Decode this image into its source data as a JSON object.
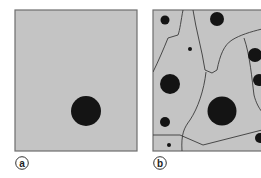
{
  "colors": {
    "panel_fill": "#c4c4c4",
    "panel_border": "#6e6e6e",
    "particle": "#141414",
    "boundary": "#3a3a3a",
    "label_stroke": "#333333"
  },
  "panels": [
    {
      "id": "a",
      "label": "a",
      "description": "single particle",
      "rect": {
        "x": 15,
        "y": 10,
        "w": 122,
        "h": 141
      },
      "particles": [
        {
          "cx": 86,
          "cy": 111,
          "r": 15
        }
      ],
      "boundaries": []
    },
    {
      "id": "b",
      "label": "b",
      "description": "many particles with boundaries",
      "rect": {
        "x": 153,
        "y": 10,
        "w": 110,
        "h": 141
      },
      "particles": [
        {
          "cx": 165,
          "cy": 20,
          "r": 4.5
        },
        {
          "cx": 217,
          "cy": 19,
          "r": 7
        },
        {
          "cx": 190,
          "cy": 49,
          "r": 2
        },
        {
          "cx": 255,
          "cy": 55,
          "r": 7
        },
        {
          "cx": 170,
          "cy": 84,
          "r": 10
        },
        {
          "cx": 259,
          "cy": 80,
          "r": 6
        },
        {
          "cx": 222,
          "cy": 111,
          "r": 14.5
        },
        {
          "cx": 165,
          "cy": 122,
          "r": 5
        },
        {
          "cx": 260,
          "cy": 138,
          "r": 5
        },
        {
          "cx": 169,
          "cy": 145,
          "r": 2
        }
      ],
      "boundaries": [
        "M183,10 C181,20 180,30 178,35 L168,38 C164,48 158,62 153,72",
        "M193,10 C196,30 202,50 205,70 L212,73 L217,70 C220,55 224,45 232,40 C240,35 250,32 262,29",
        "M244,38 C250,55 252,80 254,95 C256,103 259,108 262,112",
        "M206,72 C204,90 198,108 190,120 C184,128 181,134 182,151",
        "M153,135 L180,135 L203,145 L262,130"
      ]
    }
  ]
}
